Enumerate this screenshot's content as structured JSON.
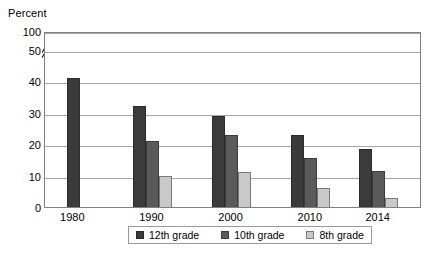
{
  "chart_data": {
    "type": "bar",
    "title": "",
    "ylabel": "Percent",
    "xlabel": "",
    "categories": [
      "1980",
      "1990",
      "2000",
      "2010",
      "2014"
    ],
    "series": [
      {
        "name": "12th grade",
        "color": "#3b3b3b",
        "values": [
          41,
          32,
          29,
          23,
          18.5
        ]
      },
      {
        "name": "10th grade",
        "color": "#5a5a5a",
        "values": [
          null,
          21,
          23,
          15.5,
          11.5
        ]
      },
      {
        "name": "8th grade",
        "color": "#c9c9c9",
        "values": [
          null,
          10,
          11,
          6,
          3
        ]
      }
    ],
    "ylim": [
      0,
      50
    ],
    "yticks": [
      {
        "label": "0",
        "value": 0
      },
      {
        "label": "10",
        "value": 10
      },
      {
        "label": "20",
        "value": 20
      },
      {
        "label": "30",
        "value": 30
      },
      {
        "label": "40",
        "value": 40
      },
      {
        "label": "50",
        "value": 50
      },
      {
        "label": "100",
        "value": 56
      }
    ],
    "axis_break": true,
    "grid": true,
    "legend_position": "bottom",
    "legend": [
      "12th grade",
      "10th grade",
      "8th grade"
    ]
  }
}
